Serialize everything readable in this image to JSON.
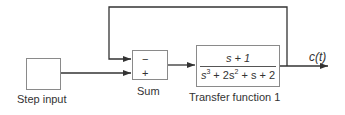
{
  "diagram": {
    "type": "block-diagram",
    "blocks": {
      "step": {
        "label": "Step input"
      },
      "sum": {
        "label": "Sum",
        "signs": [
          "−",
          "+"
        ]
      },
      "transfer": {
        "label": "Transfer function 1",
        "numerator": "s + 1",
        "denominator_parts": [
          "s",
          "3",
          " + 2s",
          "2",
          " + s + 2"
        ]
      }
    },
    "output_label": "c(t)",
    "colors": {
      "line": "#333333",
      "block_border": "#8a8a8a"
    }
  }
}
